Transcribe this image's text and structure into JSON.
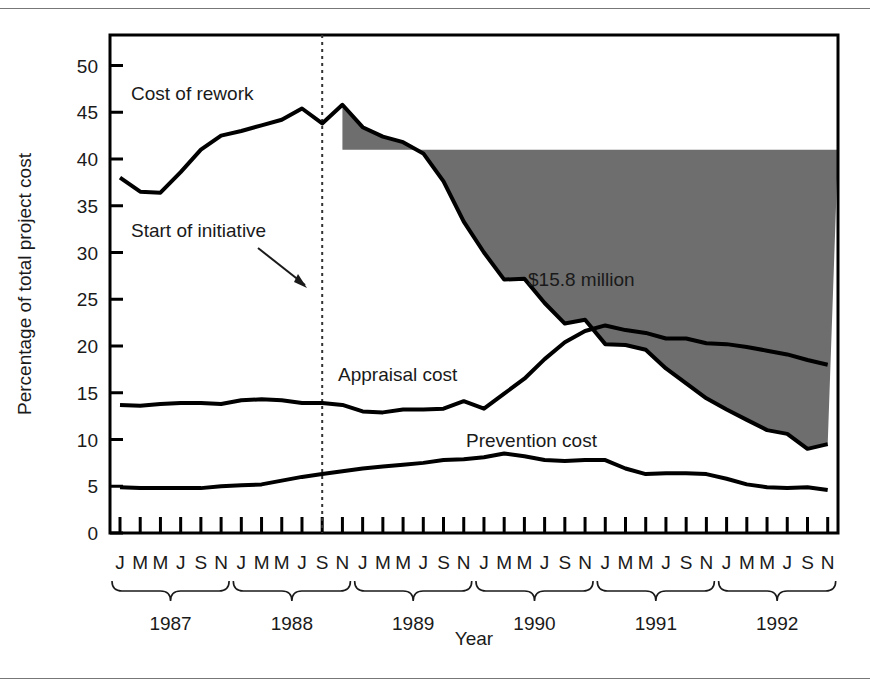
{
  "figure": {
    "background": "#ffffff",
    "rule_color": "#777777",
    "frame_color": "#000000",
    "shade_color": "#6e6e6e",
    "line_color": "#000000"
  },
  "chart_data": {
    "type": "line",
    "title": "",
    "subtitle": "",
    "xlabel": "Year",
    "ylabel": "Percentage of total project cost",
    "ylim": [
      0,
      52
    ],
    "yticks": [
      0,
      5,
      10,
      15,
      20,
      25,
      30,
      35,
      40,
      45,
      50
    ],
    "ytick_labels": [
      "0",
      "5",
      "10",
      "15",
      "20",
      "25",
      "30",
      "35",
      "40",
      "45",
      "50"
    ],
    "grid": false,
    "legend_position": "inline-labels",
    "x_tick_months": [
      "J",
      "M",
      "M",
      "J",
      "S",
      "N"
    ],
    "years": [
      "1987",
      "1988",
      "1989",
      "1990",
      "1991",
      "1992"
    ],
    "x": [
      "1987-J",
      "1987-M",
      "1987-M",
      "1987-J",
      "1987-S",
      "1987-N",
      "1988-J",
      "1988-M",
      "1988-M",
      "1988-J",
      "1988-S",
      "1988-N",
      "1989-J",
      "1989-M",
      "1989-M",
      "1989-J",
      "1989-S",
      "1989-N",
      "1990-J",
      "1990-M",
      "1990-M",
      "1990-J",
      "1990-S",
      "1990-N",
      "1991-J",
      "1991-M",
      "1991-M",
      "1991-J",
      "1991-S",
      "1991-N",
      "1992-J",
      "1992-M",
      "1992-M",
      "1992-J",
      "1992-S",
      "1992-N"
    ],
    "series": [
      {
        "name": "Cost of rework",
        "label": "Cost of rework",
        "values": [
          38.0,
          36.5,
          36.4,
          38.6,
          41.0,
          42.5,
          43.0,
          43.6,
          44.2,
          45.4,
          43.8,
          45.8,
          43.4,
          42.4,
          41.8,
          40.6,
          37.6,
          33.3,
          30.0,
          27.1,
          27.2,
          24.6,
          22.4,
          22.8,
          20.2,
          20.1,
          19.6,
          17.6,
          16.0,
          14.4,
          13.2,
          12.1,
          11.0,
          10.6,
          9.0,
          9.5
        ]
      },
      {
        "name": "Appraisal cost",
        "label": "Appraisal cost",
        "values": [
          13.7,
          13.6,
          13.8,
          13.9,
          13.9,
          13.8,
          14.2,
          14.3,
          14.2,
          13.9,
          13.9,
          13.7,
          13.0,
          12.9,
          13.2,
          13.2,
          13.3,
          14.1,
          13.3,
          14.9,
          16.5,
          18.6,
          20.4,
          21.6,
          22.2,
          21.7,
          21.4,
          20.8,
          20.8,
          20.3,
          20.2,
          19.9,
          19.5,
          19.1,
          18.5,
          18.0
        ]
      },
      {
        "name": "Prevention cost",
        "label": "Prevention cost",
        "values": [
          4.9,
          4.8,
          4.8,
          4.8,
          4.8,
          5.0,
          5.1,
          5.2,
          5.6,
          6.0,
          6.3,
          6.6,
          6.9,
          7.1,
          7.3,
          7.5,
          7.8,
          7.9,
          8.1,
          8.5,
          8.2,
          7.8,
          7.7,
          7.8,
          7.8,
          6.9,
          6.3,
          6.4,
          6.4,
          6.3,
          5.8,
          5.2,
          4.9,
          4.8,
          4.9,
          4.6
        ]
      }
    ],
    "shaded_region": {
      "label": "$15.8 million",
      "description": "Savings area between the pre-initiative 41% baseline and the cost-of-rework curve after the initiative start",
      "baseline_value": 41,
      "start_x": "1988-S",
      "color": "#6e6e6e"
    },
    "annotations": [
      {
        "name": "start-of-initiative",
        "text": "Start of initiative",
        "target_x": "1988-S",
        "marker": "dotted-vertical-line-with-arrow"
      }
    ]
  }
}
